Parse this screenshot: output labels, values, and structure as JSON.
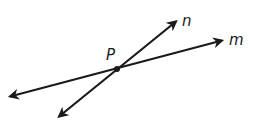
{
  "diagram": {
    "type": "intersecting-lines",
    "stroke_color": "#1a1a1a",
    "background_color": "#ffffff",
    "point": {
      "label": "P",
      "x": 117,
      "y": 69
    },
    "lines": [
      {
        "name": "n",
        "label": "n",
        "start": {
          "x": 57,
          "y": 118
        },
        "end": {
          "x": 178,
          "y": 20
        }
      },
      {
        "name": "m",
        "label": "m",
        "start": {
          "x": 8,
          "y": 97
        },
        "end": {
          "x": 224,
          "y": 40
        }
      }
    ],
    "labels": {
      "P": "P",
      "n": "n",
      "m": "m"
    }
  }
}
